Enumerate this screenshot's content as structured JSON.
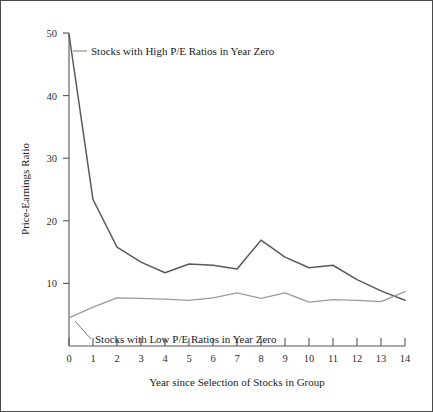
{
  "figure": {
    "background_color": "#ffffff",
    "frame_color": "#4a4a4a"
  },
  "chart_data": {
    "type": "line",
    "title": "",
    "xlabel": "Year since Selection of Stocks in Group",
    "ylabel": "Price-Earnings Ratio",
    "xlim": [
      0,
      14
    ],
    "ylim": [
      0,
      50
    ],
    "xticks": [
      0,
      1,
      2,
      3,
      4,
      5,
      6,
      7,
      8,
      9,
      10,
      11,
      12,
      13,
      14
    ],
    "xticklabels": [
      "0",
      "1",
      "2",
      "3",
      "4",
      "5",
      "6",
      "7",
      "8",
      "9",
      "10",
      "11",
      "12",
      "13",
      "14"
    ],
    "yticks": [
      10,
      20,
      30,
      40,
      50
    ],
    "yticklabels": [
      "10",
      "20",
      "30",
      "40",
      "50"
    ],
    "grid": false,
    "legend": "annotations",
    "x": [
      0,
      1,
      2,
      3,
      4,
      5,
      6,
      7,
      8,
      9,
      10,
      11,
      12,
      13,
      14
    ],
    "series": [
      {
        "name": "Stocks with High P/E Ratios in Year Zero",
        "color": "#5a5a5a",
        "linewidth": 1.5,
        "values": [
          49.8,
          23.4,
          15.8,
          13.4,
          11.7,
          13.1,
          12.9,
          12.3,
          16.9,
          14.2,
          12.5,
          12.9,
          10.6,
          8.8,
          7.3
        ]
      },
      {
        "name": "Stocks with Low P/E Ratios in Year Zero",
        "color": "#9b9b9b",
        "linewidth": 1.3,
        "values": [
          4.5,
          6.2,
          7.7,
          7.6,
          7.5,
          7.3,
          7.7,
          8.5,
          7.6,
          8.5,
          7.0,
          7.4,
          7.3,
          7.1,
          8.7
        ]
      }
    ],
    "annotations": [
      {
        "id": "high-pe-annotation",
        "text": "Stocks with High P/E Ratios in Year Zero",
        "anchor_x": 0.15,
        "anchor_y": 47.5
      },
      {
        "id": "low-pe-annotation",
        "text": "Stocks with Low P/E Ratios in Year Zero",
        "anchor_x": 0.2,
        "anchor_y": 4.0
      }
    ]
  }
}
